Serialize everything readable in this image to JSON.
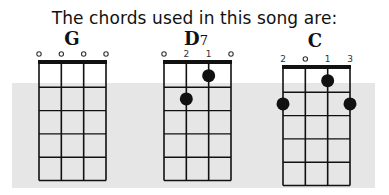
{
  "title": "The chords used in this song are:",
  "colors": {
    "background": "#ffffff",
    "band": "#e6e6e6",
    "ink": "#111111"
  },
  "chords": [
    {
      "name": "G",
      "suffix": "",
      "strings": 4,
      "frets": 5,
      "top_labels": [
        "o",
        "o",
        "o",
        "o"
      ],
      "dots": []
    },
    {
      "name": "D",
      "suffix": "7",
      "strings": 4,
      "frets": 5,
      "top_labels": [
        "o",
        "2",
        "1",
        "o"
      ],
      "dots": [
        {
          "string": 3,
          "fret": 1
        },
        {
          "string": 2,
          "fret": 2
        }
      ]
    },
    {
      "name": "C",
      "suffix": "",
      "strings": 4,
      "frets": 5,
      "top_labels": [
        "2",
        "o",
        "1",
        "3"
      ],
      "dots": [
        {
          "string": 3,
          "fret": 1
        },
        {
          "string": 1,
          "fret": 2
        },
        {
          "string": 4,
          "fret": 2
        }
      ]
    }
  ]
}
